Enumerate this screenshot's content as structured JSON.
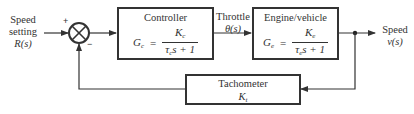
{
  "diagram": {
    "type": "feedback control block diagram",
    "input": {
      "label_line1": "Speed",
      "label_line2": "setting",
      "signal": "R(s)"
    },
    "summing_junction": {
      "plus_sign": "+",
      "minus_sign": "−"
    },
    "blocks": [
      {
        "id": "controller",
        "title": "Controller",
        "gain_symbol": "G",
        "gain_sub": "c",
        "numerator": "K",
        "numerator_sub": "c",
        "tau": "τ",
        "tau_sub": "c",
        "den_rest": "s + 1",
        "equals": "="
      },
      {
        "id": "engine",
        "title": "Engine/vehicle",
        "gain_symbol": "G",
        "gain_sub": "e",
        "numerator": "K",
        "numerator_sub": "e",
        "tau": "τ",
        "tau_sub": "e",
        "den_rest": "s + 1",
        "equals": "="
      },
      {
        "id": "tachometer",
        "title": "Tachometer",
        "gain": "K",
        "gain_sub": "t"
      }
    ],
    "intermediate_signal": {
      "label": "Throttle",
      "signal": "θ(s)"
    },
    "output": {
      "label": "Speed",
      "signal": "v(s)"
    },
    "colors": {
      "line": "#333333",
      "background": "#ffffff"
    }
  }
}
